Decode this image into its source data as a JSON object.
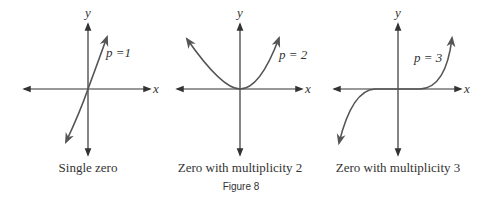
{
  "figure": {
    "label": "Figure 8",
    "colors": {
      "axis": "#333333",
      "curve": "#555555",
      "text": "#333333"
    }
  },
  "panels": [
    {
      "caption": "Single zero",
      "curve_label": "p =1",
      "x_axis": "x",
      "y_axis": "y",
      "multiplicity": 1
    },
    {
      "caption": "Zero with multiplicity 2",
      "curve_label": "p = 2",
      "x_axis": "x",
      "y_axis": "y",
      "multiplicity": 2
    },
    {
      "caption": "Zero with multiplicity 3",
      "curve_label": "p = 3",
      "x_axis": "x",
      "y_axis": "y",
      "multiplicity": 3
    }
  ]
}
